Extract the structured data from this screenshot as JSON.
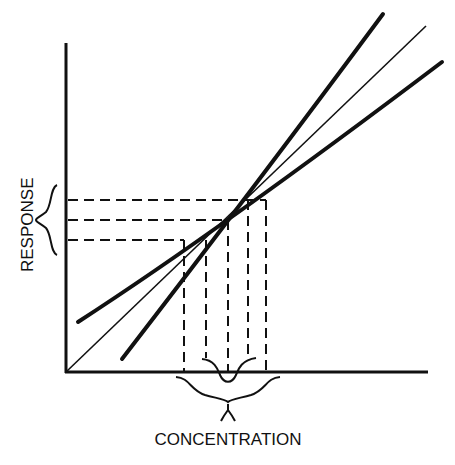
{
  "diagram": {
    "x_axis_label": "CONCENTRATION",
    "y_axis_label": "RESPONSE",
    "curves": [
      {
        "name": "upper-bound",
        "style": "thick"
      },
      {
        "name": "calibration-line",
        "style": "thin"
      },
      {
        "name": "lower-bound",
        "style": "thick"
      }
    ],
    "response_levels": [
      "high",
      "mid",
      "low"
    ],
    "concentration_marks": 5,
    "colors": {
      "ink": "#111111",
      "background": "#ffffff"
    }
  }
}
